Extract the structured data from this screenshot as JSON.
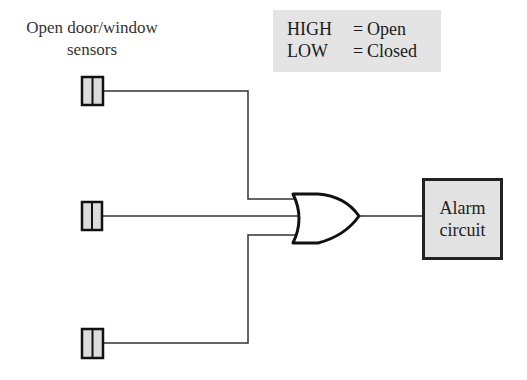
{
  "diagram": {
    "title_label": {
      "line1": "Open door/window",
      "line2": "sensors"
    },
    "legend": {
      "rows": [
        {
          "key": "HIGH",
          "eq": "=",
          "value": "Open"
        },
        {
          "key": "LOW",
          "eq": "=",
          "value": "Closed"
        }
      ],
      "background": "#e4e4e4"
    },
    "sensors": [
      {
        "id": 1,
        "y": 91
      },
      {
        "id": 2,
        "y": 216
      },
      {
        "id": 3,
        "y": 343
      }
    ],
    "gate": {
      "type": "OR",
      "inputs": 3
    },
    "output": {
      "line1": "Alarm",
      "line2": "circuit",
      "background": "#e2e2e2"
    }
  }
}
